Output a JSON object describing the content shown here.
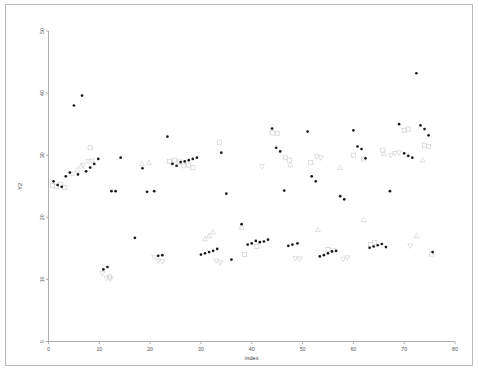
{
  "figure": {
    "title": "",
    "border_color": "#b9b9b9",
    "background": "#ffffff"
  },
  "axes": {
    "x_label": "index",
    "y_label": "Y2",
    "x_ticks": [
      "0",
      "10",
      "20",
      "30",
      "40",
      "50",
      "60",
      "70",
      "80"
    ],
    "y_ticks": [
      "0",
      "10",
      "20",
      "30",
      "40",
      "50"
    ],
    "axis_color": "#9a9a9a",
    "tick_label_color": "#555555"
  },
  "chart_data": {
    "type": "scatter",
    "title": "",
    "xlabel": "index",
    "ylabel": "Y2",
    "xlim": [
      0,
      80
    ],
    "ylim": [
      0,
      50
    ],
    "xticks": [
      0,
      10,
      20,
      30,
      40,
      50,
      60,
      70,
      80
    ],
    "yticks": [
      0,
      10,
      20,
      30,
      40,
      50
    ],
    "grid": false,
    "legend": "none",
    "series": [
      {
        "name": "circle-series",
        "marker": "filled-circle",
        "color": "#1a1a1a",
        "points": [
          [
            1.0,
            25.8
          ],
          [
            1.8,
            25.2
          ],
          [
            2.6,
            24.9
          ],
          [
            3.4,
            26.6
          ],
          [
            4.2,
            27.2
          ],
          [
            5.0,
            38.0
          ],
          [
            5.8,
            26.9
          ],
          [
            6.6,
            39.6
          ],
          [
            7.4,
            27.4
          ],
          [
            8.2,
            28.0
          ],
          [
            9.0,
            28.6
          ],
          [
            9.8,
            29.4
          ],
          [
            10.8,
            11.6
          ],
          [
            11.6,
            12.0
          ],
          [
            12.4,
            24.2
          ],
          [
            13.2,
            24.2
          ],
          [
            14.2,
            29.6
          ],
          [
            17.0,
            16.7
          ],
          [
            18.5,
            27.9
          ],
          [
            19.4,
            24.1
          ],
          [
            20.8,
            24.2
          ],
          [
            21.6,
            13.8
          ],
          [
            22.4,
            13.9
          ],
          [
            23.4,
            33.0
          ],
          [
            24.4,
            28.6
          ],
          [
            25.2,
            28.3
          ],
          [
            26.0,
            28.9
          ],
          [
            26.8,
            29.0
          ],
          [
            27.6,
            29.2
          ],
          [
            28.4,
            29.4
          ],
          [
            29.2,
            29.6
          ],
          [
            30.0,
            14.0
          ],
          [
            30.8,
            14.2
          ],
          [
            31.6,
            14.4
          ],
          [
            32.4,
            14.6
          ],
          [
            33.2,
            14.9
          ],
          [
            34.0,
            30.4
          ],
          [
            35.0,
            23.8
          ],
          [
            36.0,
            13.2
          ],
          [
            38.0,
            18.9
          ],
          [
            39.2,
            15.6
          ],
          [
            40.0,
            15.8
          ],
          [
            40.8,
            16.2
          ],
          [
            41.6,
            16.0
          ],
          [
            42.4,
            16.1
          ],
          [
            43.2,
            16.4
          ],
          [
            44.0,
            34.3
          ],
          [
            44.8,
            31.2
          ],
          [
            45.6,
            30.6
          ],
          [
            46.4,
            24.3
          ],
          [
            47.2,
            15.4
          ],
          [
            48.0,
            15.6
          ],
          [
            49.0,
            15.8
          ],
          [
            51.0,
            33.8
          ],
          [
            51.8,
            26.6
          ],
          [
            52.6,
            25.8
          ],
          [
            53.4,
            13.7
          ],
          [
            54.2,
            13.9
          ],
          [
            55.0,
            14.2
          ],
          [
            55.8,
            14.5
          ],
          [
            56.6,
            14.6
          ],
          [
            57.4,
            23.4
          ],
          [
            58.2,
            22.9
          ],
          [
            60.0,
            34.0
          ],
          [
            60.8,
            31.4
          ],
          [
            61.6,
            31.0
          ],
          [
            62.4,
            29.5
          ],
          [
            63.2,
            15.1
          ],
          [
            64.0,
            15.3
          ],
          [
            64.8,
            15.5
          ],
          [
            65.6,
            15.7
          ],
          [
            66.4,
            15.2
          ],
          [
            67.2,
            24.2
          ],
          [
            69.0,
            35.0
          ],
          [
            70.0,
            30.3
          ],
          [
            70.8,
            29.9
          ],
          [
            71.6,
            29.6
          ],
          [
            72.4,
            43.2
          ],
          [
            73.2,
            34.8
          ],
          [
            74.0,
            34.2
          ],
          [
            74.8,
            33.2
          ],
          [
            75.6,
            14.4
          ]
        ]
      },
      {
        "name": "square-series",
        "marker": "open-square",
        "color": "#d4d4d4",
        "points": [
          [
            0.8,
            25.1
          ],
          [
            1.6,
            25.0
          ],
          [
            2.4,
            25.3
          ],
          [
            3.2,
            24.8
          ],
          [
            8.2,
            31.2
          ],
          [
            12.0,
            10.4
          ],
          [
            23.8,
            29.0
          ],
          [
            24.8,
            29.2
          ],
          [
            25.8,
            28.9
          ],
          [
            26.6,
            28.3
          ],
          [
            27.6,
            28.4
          ],
          [
            28.4,
            28.0
          ],
          [
            33.6,
            32.1
          ],
          [
            38.6,
            14.0
          ],
          [
            41.0,
            15.3
          ],
          [
            44.0,
            33.6
          ],
          [
            45.0,
            33.5
          ],
          [
            46.6,
            29.6
          ],
          [
            47.4,
            29.2
          ],
          [
            51.6,
            28.8
          ],
          [
            55.0,
            14.8
          ],
          [
            56.0,
            14.6
          ],
          [
            60.0,
            30.0
          ],
          [
            62.0,
            29.4
          ],
          [
            63.4,
            15.6
          ],
          [
            64.2,
            15.9
          ],
          [
            65.8,
            30.8
          ],
          [
            70.0,
            34.0
          ],
          [
            70.8,
            34.2
          ],
          [
            74.0,
            31.6
          ],
          [
            74.8,
            31.4
          ],
          [
            75.4,
            14.1
          ]
        ]
      },
      {
        "name": "triangle-up-series",
        "marker": "open-triangle-up",
        "color": "#d6d6d6",
        "points": [
          [
            4.6,
            27.0
          ],
          [
            5.6,
            27.6
          ],
          [
            6.4,
            28.2
          ],
          [
            18.4,
            28.6
          ],
          [
            19.8,
            28.8
          ],
          [
            30.8,
            16.5
          ],
          [
            31.6,
            17.0
          ],
          [
            32.4,
            17.6
          ],
          [
            38.0,
            18.4
          ],
          [
            47.6,
            28.4
          ],
          [
            53.0,
            18.0
          ],
          [
            57.4,
            28.0
          ],
          [
            62.0,
            19.6
          ],
          [
            66.0,
            30.2
          ],
          [
            72.4,
            17.0
          ],
          [
            73.6,
            29.2
          ]
        ]
      },
      {
        "name": "triangle-down-series",
        "marker": "open-triangle-down",
        "color": "#d6d6d6",
        "points": [
          [
            6.8,
            28.4
          ],
          [
            7.8,
            29.0
          ],
          [
            8.6,
            29.1
          ],
          [
            10.6,
            11.0
          ],
          [
            11.4,
            10.2
          ],
          [
            12.2,
            10.1
          ],
          [
            20.8,
            13.6
          ],
          [
            21.6,
            13.0
          ],
          [
            22.4,
            12.9
          ],
          [
            33.0,
            13.0
          ],
          [
            33.8,
            12.7
          ],
          [
            42.0,
            28.2
          ],
          [
            48.6,
            13.4
          ],
          [
            49.4,
            13.3
          ],
          [
            52.8,
            29.8
          ],
          [
            53.6,
            29.6
          ],
          [
            58.0,
            13.3
          ],
          [
            58.8,
            13.5
          ],
          [
            67.4,
            30.0
          ],
          [
            68.2,
            30.3
          ],
          [
            69.0,
            30.4
          ],
          [
            71.2,
            15.4
          ]
        ]
      }
    ]
  }
}
